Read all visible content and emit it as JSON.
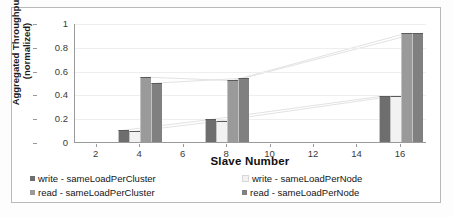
{
  "chart_data": {
    "type": "bar",
    "title": "",
    "xlabel": "Slave Number",
    "ylabel": "Aggregated Throughput\n(normalized)",
    "ylabel_line1": "Aggregated Throughput",
    "ylabel_line2": "(normalized)",
    "xlim": [
      1,
      17.2
    ],
    "ylim": [
      0,
      1
    ],
    "x_ticks": [
      2,
      4,
      6,
      8,
      10,
      12,
      14,
      16
    ],
    "x_tick_labels": [
      "2",
      "4",
      "6",
      "8",
      "10",
      "12",
      "14",
      "16"
    ],
    "y_ticks": [
      0,
      0.2,
      0.4,
      0.6,
      0.8,
      1
    ],
    "y_tick_labels": [
      "0",
      "0.2",
      "0.4",
      "0.6",
      "0.8",
      "1"
    ],
    "grid": true,
    "legend_position": "bottom",
    "categories": [
      4,
      8,
      16
    ],
    "category_labels": [
      "4",
      "8",
      "16"
    ],
    "series": [
      {
        "name": "write - sameLoadPerCluster",
        "color": "#6e6e6e",
        "values": [
          0.1,
          0.19,
          0.39
        ]
      },
      {
        "name": "write - sameLoadPerNode",
        "color": "#f2f2f2",
        "values": [
          0.09,
          0.18,
          0.39
        ]
      },
      {
        "name": "read - sameLoadPerCluster",
        "color": "#9a9a9a",
        "values": [
          0.55,
          0.52,
          0.92
        ]
      },
      {
        "name": "read - sameLoadPerNode",
        "color": "#808080",
        "values": [
          0.5,
          0.54,
          0.92
        ]
      }
    ]
  },
  "legend": {
    "items": [
      {
        "label": "write - sameLoadPerCluster",
        "color": "#6e6e6e"
      },
      {
        "label": "write - sameLoadPerNode",
        "color": "#f2f2f2"
      },
      {
        "label": "read - sameLoadPerCluster",
        "color": "#9a9a9a"
      },
      {
        "label": "read - sameLoadPerNode",
        "color": "#808080"
      }
    ]
  },
  "axes": {
    "x_title": "Slave Number",
    "y_title_line1": "Aggregated Throughput",
    "y_title_line2": "(normalized)"
  }
}
